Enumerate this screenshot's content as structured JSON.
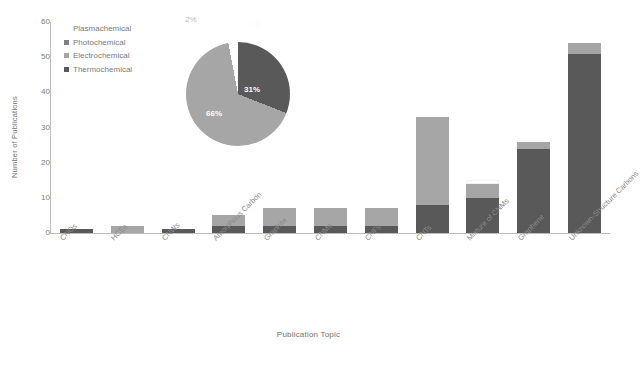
{
  "chart_data": {
    "type": "bar",
    "subtype": "stacked-bar-with-inset-pie",
    "title": "",
    "xlabel": "Publication Topic",
    "ylabel": "Number of Publications",
    "ylim": [
      0,
      60
    ],
    "yticks": [
      0,
      10,
      20,
      30,
      40,
      50,
      60
    ],
    "grid": false,
    "legend_position": "upper-left-inside",
    "categories": [
      "CNOs",
      "HCSs",
      "CNWs",
      "Amorphous Carbon",
      "Graphite",
      "CNMs",
      "CNFs",
      "CNTs",
      "Mixture of CNMs",
      "Graphene",
      "Unknown-Structure Carbons"
    ],
    "series": [
      {
        "name": "Thermochemical",
        "color": "#595959",
        "values": [
          1,
          0,
          1,
          2,
          2,
          2,
          2,
          8,
          10,
          24,
          51
        ]
      },
      {
        "name": "Electrochemical",
        "color": "#a6a6a6",
        "values": [
          0,
          2,
          0,
          3,
          5,
          5,
          5,
          25,
          4,
          2,
          3
        ]
      },
      {
        "name": "Photochemical",
        "color": "#808080",
        "values": [
          0,
          0,
          0,
          0,
          0,
          0,
          0,
          0,
          0,
          0,
          0
        ]
      },
      {
        "name": "Plasmachemical",
        "color": "#ffffff",
        "values": [
          0,
          0,
          0,
          0,
          0,
          0,
          0,
          0,
          1,
          0,
          0
        ]
      }
    ],
    "totals": [
      1,
      2,
      1,
      5,
      7,
      7,
      7,
      33,
      15,
      26,
      54
    ],
    "pie": {
      "labels": [
        "Thermochemical",
        "Electrochemical",
        "Photochemical",
        "Plasmachemical"
      ],
      "values": [
        31,
        66,
        2,
        1
      ],
      "display_labels": [
        "31%",
        "66%",
        "2%",
        "1%"
      ],
      "colors": [
        "#595959",
        "#a6a6a6",
        "#ffffff",
        "#fdfdfd"
      ]
    }
  },
  "axes": {
    "y_title": "Number of Publications",
    "x_title": "Publication Topic",
    "y_ticks": [
      "60",
      "50",
      "40",
      "30",
      "20",
      "10",
      "0"
    ]
  },
  "legend": {
    "items": [
      {
        "label": "Plasmachemical",
        "color": "#fefefe"
      },
      {
        "label": "Photochemical",
        "color": "#808080"
      },
      {
        "label": "Electrochemical",
        "color": "#a6a6a6"
      },
      {
        "label": "Thermochemical",
        "color": "#595959"
      }
    ]
  },
  "pie_labels": {
    "two_percent": "2%",
    "one_percent": "1%",
    "thirty_one_percent": "31%",
    "sixty_six_percent": "66%"
  }
}
